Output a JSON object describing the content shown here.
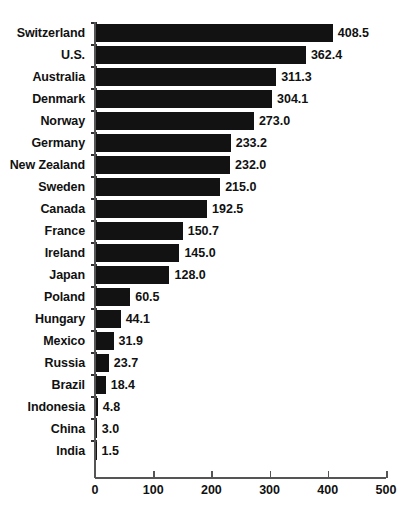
{
  "chart_data": {
    "type": "bar",
    "orientation": "horizontal",
    "title": "",
    "subtitle": "",
    "xlabel": "",
    "ylabel": "",
    "xlim": [
      0,
      500
    ],
    "xticks": [
      0,
      100,
      200,
      300,
      400,
      500
    ],
    "xtick_labels": [
      "0",
      "100",
      "200",
      "300",
      "400",
      "500"
    ],
    "grid": false,
    "legend": null,
    "bar_color": "#121212",
    "axis_color": "#555555",
    "background": "#ffffff",
    "categories": [
      "Switzerland",
      "U.S.",
      "Australia",
      "Denmark",
      "Norway",
      "Germany",
      "New Zealand",
      "Sweden",
      "Canada",
      "France",
      "Ireland",
      "Japan",
      "Poland",
      "Hungary",
      "Mexico",
      "Russia",
      "Brazil",
      "Indonesia",
      "China",
      "India"
    ],
    "values": [
      408.5,
      362.4,
      311.3,
      304.1,
      273.0,
      233.2,
      232.0,
      215.0,
      192.5,
      150.7,
      145.0,
      128.0,
      60.5,
      44.1,
      31.9,
      23.7,
      18.4,
      4.8,
      3.0,
      1.5
    ],
    "value_labels": [
      "408.5",
      "362.4",
      "311.3",
      "304.1",
      "273.0",
      "233.2",
      "232.0",
      "215.0",
      "192.5",
      "150.7",
      "145.0",
      "128.0",
      "60.5",
      "44.1",
      "31.9",
      "23.7",
      "18.4",
      "4.8",
      "3.0",
      "1.5"
    ]
  },
  "figure": {
    "title_fragment": "",
    "source_caption_fragment": ""
  }
}
